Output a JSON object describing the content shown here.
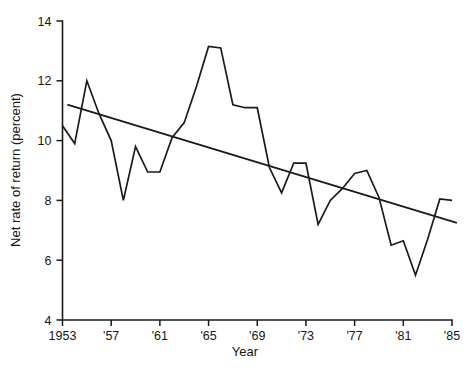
{
  "chart_data": {
    "type": "line",
    "title": "",
    "xlabel": "Year",
    "ylabel": "Net rate of return (percent)",
    "xlim": [
      1953,
      1985
    ],
    "ylim": [
      4,
      14
    ],
    "grid": false,
    "legend": "none",
    "x_tick_labels": [
      "1953",
      "'57",
      "'61",
      "'65",
      "'69",
      "'73",
      "'77",
      "'81",
      "'85"
    ],
    "x_tick_values": [
      1953,
      1957,
      1961,
      1965,
      1969,
      1973,
      1977,
      1981,
      1985
    ],
    "y_tick_labels": [
      "4",
      "6",
      "8",
      "10",
      "12",
      "14"
    ],
    "y_tick_values": [
      4,
      6,
      8,
      10,
      12,
      14
    ],
    "x": [
      1953,
      1954,
      1955,
      1956,
      1957,
      1958,
      1959,
      1960,
      1961,
      1962,
      1963,
      1964,
      1965,
      1966,
      1967,
      1968,
      1969,
      1970,
      1971,
      1972,
      1973,
      1974,
      1975,
      1976,
      1977,
      1978,
      1979,
      1980,
      1981,
      1982,
      1983,
      1984,
      1985
    ],
    "series": [
      {
        "name": "Net rate of return",
        "style": "solid-line",
        "color": "#1a1a1a",
        "values": [
          10.5,
          9.9,
          12.0,
          10.9,
          10.0,
          8.0,
          9.8,
          8.95,
          8.95,
          10.1,
          10.6,
          11.8,
          13.15,
          13.1,
          11.2,
          11.1,
          11.1,
          9.1,
          8.25,
          9.25,
          9.25,
          7.2,
          8.0,
          8.4,
          8.9,
          9.0,
          8.1,
          6.5,
          6.65,
          5.5,
          6.7,
          8.05,
          8.0
        ]
      },
      {
        "name": "Linear trend",
        "style": "straight-line",
        "color": "#1a1a1a",
        "endpoints": [
          {
            "x": 1953.4,
            "y": 11.2
          },
          {
            "x": 1985.4,
            "y": 7.25
          }
        ]
      }
    ]
  },
  "axes": {
    "x_title": "Year",
    "y_title": "Net rate of return (percent)"
  }
}
